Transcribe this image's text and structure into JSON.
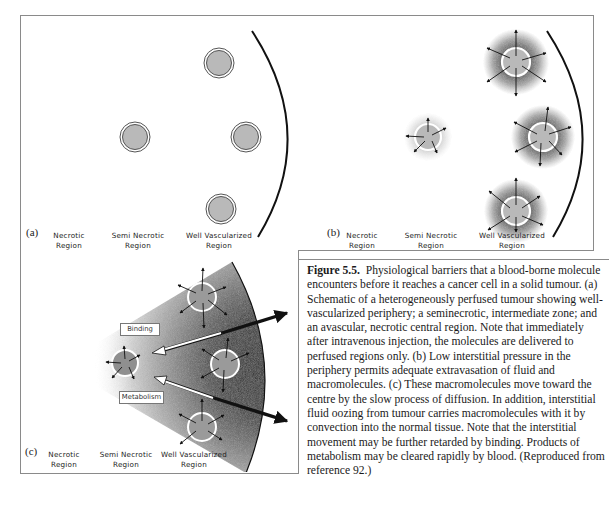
{
  "figure": {
    "number": "Figure 5.5.",
    "caption": "Physiological barriers that a blood-borne molecule encounters before it reaches a cancer cell in a solid tumour. (a) Schematic of a heterogeneously perfused tumour showing well-vascularized periphery; a seminecrotic, intermediate zone; and an avascular, necrotic central region. Note that immediately after intravenous injection, the molecules are delivered to perfused regions only. (b) Low interstitial pressure in the periphery permits adequate extravasation of fluid and macromolecules. (c) These macromolecules move toward the centre by the slow process of diffusion. In addition, interstitial fluid oozing from tumour carries macromolecules with it by convection into the normal tissue. Note that the interstitial movement may be further retarded by binding. Products of metabolism may be cleared rapidly by blood. (Reproduced from reference 92.)"
  },
  "panels": {
    "a": {
      "letter": "(a)",
      "regions": [
        {
          "line1": "Necrotic",
          "line2": "Region"
        },
        {
          "line1": "Semi Necrotic",
          "line2": "Region"
        },
        {
          "line1": "Well Vascularized",
          "line2": "Region"
        }
      ]
    },
    "b": {
      "letter": "(b)",
      "regions": [
        {
          "line1": "Necrotic",
          "line2": "Region"
        },
        {
          "line1": "Semi Necrotic",
          "line2": "Region"
        },
        {
          "line1": "Well Vascularized",
          "line2": "Region"
        }
      ]
    },
    "c": {
      "letter": "(c)",
      "binding_label": "Binding",
      "metabolism_label": "Metabolism",
      "regions": [
        {
          "line1": "Necrotic",
          "line2": "Region"
        },
        {
          "line1": "Semi Necrotic",
          "line2": "Region"
        },
        {
          "line1": "Well Vascularized",
          "line2": "Region"
        }
      ]
    }
  },
  "colors": {
    "vessel_fill": "#b9b9b9",
    "vessel_ring": "#555555",
    "halo": "#3a3a3a",
    "frame": "#8a8a8a"
  }
}
